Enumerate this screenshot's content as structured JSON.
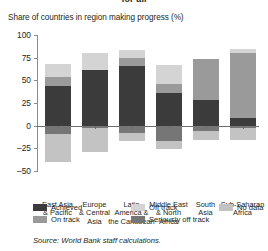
{
  "figure": {
    "clipped_title": "for all",
    "axis_title": "Share of countries in region making progress (%)",
    "source": "Source: World Bank staff calculations."
  },
  "legend": {
    "position": "bottom",
    "items": [
      {
        "label": "Achieved",
        "key": "achieved",
        "color": "#3b3b3b"
      },
      {
        "label": "On track",
        "key": "on_track",
        "color": "#9a9a9a"
      },
      {
        "label": "Off track",
        "key": "off_track",
        "color": "#d4d4d4"
      },
      {
        "label": "Seriously off track",
        "key": "seriously_off_track",
        "color": "#767676"
      },
      {
        "label": "No data",
        "key": "no_data",
        "color": "#c3c3c3"
      }
    ]
  },
  "chart_data": {
    "type": "bar",
    "stacked": true,
    "orientation": "vertical",
    "title": "for all",
    "xlabel": "",
    "ylabel": "Share of countries in region making progress (%)",
    "ylim": [
      -50,
      100
    ],
    "yticks": [
      100,
      75,
      50,
      25,
      0,
      -25,
      -50
    ],
    "ytick_labels": [
      "100",
      "75",
      "50",
      "25",
      "0",
      "–25",
      "–50"
    ],
    "grid": false,
    "categories": [
      "East Asia & Pacific",
      "Europe & Central Asia",
      "Latin America & the Caribbean",
      "Middle East & North Africa",
      "South Asia",
      "Sub-Saharan Africa"
    ],
    "category_lines": [
      [
        "East Asia",
        "& Pacific"
      ],
      [
        "Europe",
        "& Central",
        "Asia"
      ],
      [
        "Latin",
        "America &",
        "the Caribbean"
      ],
      [
        "Middle East",
        "& North",
        "Africa"
      ],
      [
        "South",
        "Asia"
      ],
      [
        "Sub-Saharan",
        "Africa"
      ]
    ],
    "series": [
      {
        "name": "Achieved",
        "color": "#3b3b3b",
        "values": [
          44,
          61,
          66,
          36,
          28,
          8
        ]
      },
      {
        "name": "On track",
        "color": "#9a9a9a",
        "values": [
          10,
          0,
          9,
          10,
          45,
          72
        ]
      },
      {
        "name": "Off track",
        "color": "#d4d4d4",
        "values": [
          14,
          19,
          8,
          21,
          0,
          5
        ]
      },
      {
        "name": "Seriously off track",
        "color": "#767676",
        "values": [
          -9,
          -3,
          -8,
          -17,
          -6,
          -3
        ]
      },
      {
        "name": "No data",
        "color": "#c3c3c3",
        "values": [
          -31,
          -26,
          -9,
          -9,
          -10,
          -13
        ]
      }
    ],
    "bar_totals_positive": [
      68,
      80,
      83,
      67,
      73,
      85
    ],
    "bar_totals_negative": [
      -40,
      -29,
      -17,
      -26,
      -16,
      -16
    ],
    "annotations": []
  }
}
